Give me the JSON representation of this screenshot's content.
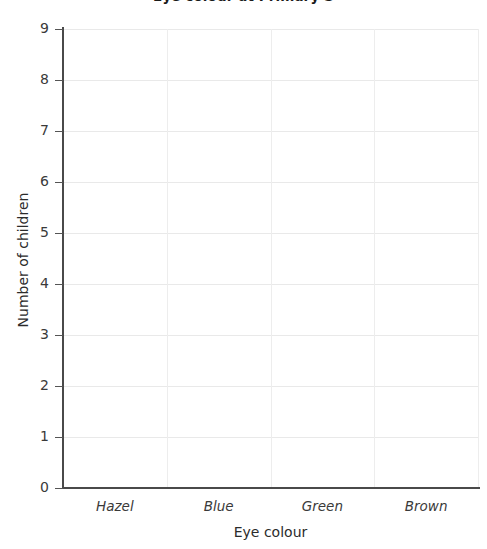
{
  "chart_data": {
    "type": "bar",
    "title": "Eye colour at Primary S",
    "xlabel": "Eye colour",
    "ylabel": "Number of children",
    "categories": [
      "Hazel",
      "Blue",
      "Green",
      "Brown"
    ],
    "values": [
      0,
      0,
      0,
      0
    ],
    "series": [
      {
        "name": "Number of children",
        "values": [
          0,
          0,
          0,
          0
        ]
      }
    ],
    "ylim": [
      0,
      9
    ],
    "ytick_labels": [
      "9",
      "8",
      "7",
      "6",
      "5",
      "4",
      "3",
      "2",
      "1",
      "0"
    ],
    "ytick_values": [
      9,
      8,
      7,
      6,
      5,
      4,
      3,
      2,
      1,
      0
    ],
    "grid": true,
    "legend": "none",
    "note": "Blank worksheet grid - no bars plotted",
    "colors": {
      "gridline": "#e9e9e9",
      "axis": "#4a4a4a",
      "text": "#2b2b2b",
      "background": "#ffffff"
    }
  }
}
